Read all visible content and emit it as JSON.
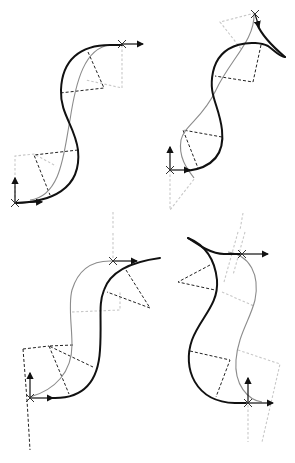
{
  "figure": {
    "colors": {
      "main_curve": "#111111",
      "reference_curve": "#8c8c8c",
      "construction_dark": "#222222",
      "construction_light": "#c8c8c8"
    },
    "panels": [
      {
        "id": "top-left",
        "shape": "S-curve",
        "frames": 2
      },
      {
        "id": "top-right",
        "shape": "S-curve with cusp tail",
        "frames": 2
      },
      {
        "id": "bottom-left",
        "shape": "S-curve",
        "frames": 2
      },
      {
        "id": "bottom-right",
        "shape": "S-curve with cusp tail",
        "frames": 2
      }
    ]
  }
}
